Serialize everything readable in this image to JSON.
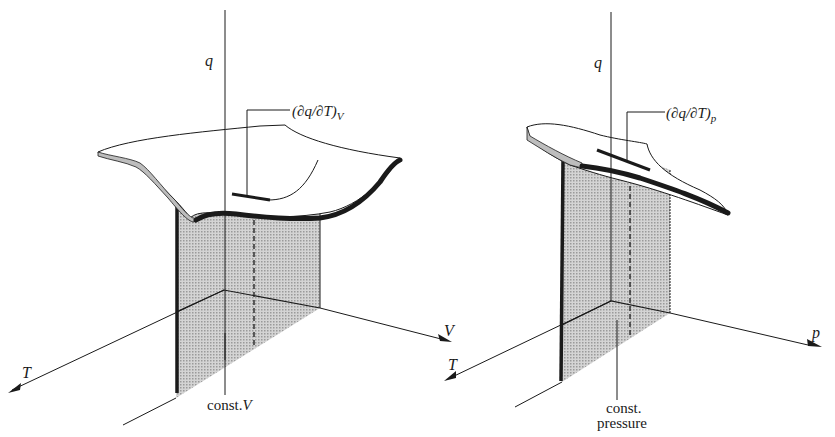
{
  "panels": [
    {
      "id": "left",
      "vertical_axis": "q",
      "horizontal_axis_right": "V",
      "horizontal_axis_left": "T",
      "derivative_label": {
        "prefix": "(∂q/∂T)",
        "subscript": "V"
      },
      "plane_label": "const. V",
      "plane_label_parts": {
        "text": "const.",
        "var": "V"
      }
    },
    {
      "id": "right",
      "vertical_axis": "q",
      "horizontal_axis_right": "p",
      "horizontal_axis_left": "T",
      "derivative_label": {
        "prefix": "(∂q/∂T)",
        "subscript": "p"
      },
      "plane_label": "const. pressure",
      "plane_label_parts": {
        "line1": "const.",
        "line2": "pressure"
      }
    }
  ],
  "colors": {
    "ink": "#1a1a1a",
    "plane_fill": "#c8c8c8",
    "surface_fill": "#ffffff"
  }
}
